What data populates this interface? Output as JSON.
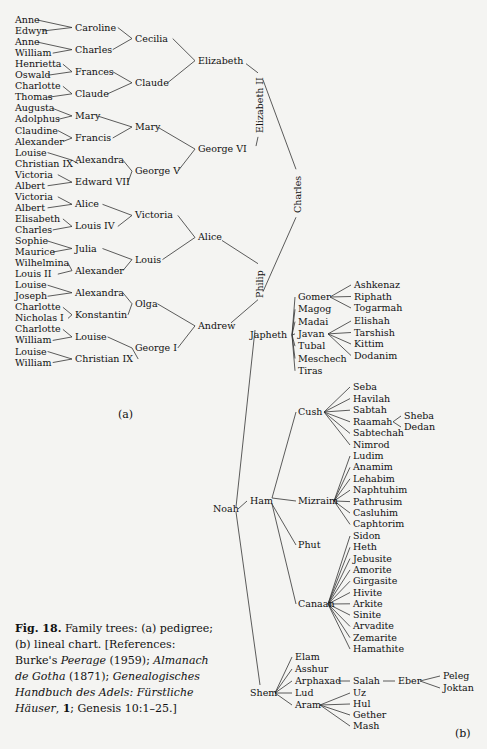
{
  "pedigree": {
    "label": "(a)",
    "gen4": [
      "Anne",
      "Edwyn",
      "Anne",
      "William",
      "Henrietta",
      "Oswald",
      "Charlotte",
      "Thomas",
      "Augusta",
      "Adolphus",
      "Claudine",
      "Alexander",
      "Louise",
      "Christian IX",
      "Victoria",
      "Albert",
      "Victoria",
      "Albert",
      "Elisabeth",
      "Charles",
      "Sophie",
      "Maurice",
      "Wilhelmina",
      "Louis II",
      "Louise",
      "Joseph",
      "Charlotte",
      "Nicholas I",
      "Charlotte",
      "William",
      "Louise",
      "William"
    ],
    "gen3": [
      "Caroline",
      "Charles",
      "Frances",
      "Claude",
      "Mary",
      "Francis",
      "Alexandra",
      "Edward VII",
      "Alice",
      "Louis IV",
      "Julia",
      "Alexander",
      "Alexandra",
      "Konstantin",
      "Louise",
      "Christian IX"
    ],
    "gen2": [
      "Cecilia",
      "Claude",
      "Mary",
      "George V",
      "Victoria",
      "Louis",
      "Olga",
      "George I"
    ],
    "gen1": [
      "Elizabeth",
      "George VI",
      "Alice",
      "Andrew"
    ],
    "gen0": [
      "Elizabeth II",
      "Philip"
    ],
    "root": "Charles"
  },
  "lineal": {
    "label": "(b)",
    "root": "Noah",
    "sons": [
      "Japheth",
      "Ham",
      "Shem"
    ],
    "japheth_children": [
      "Gomer",
      "Magog",
      "Madai",
      "Javan",
      "Tubal",
      "Meschech",
      "Tiras"
    ],
    "gomer_children": [
      "Ashkenaz",
      "Riphath",
      "Togarmah"
    ],
    "javan_children": [
      "Elishah",
      "Tarshish",
      "Kittim",
      "Dodanim"
    ],
    "ham_children": [
      "Cush",
      "Mizraim",
      "Phut",
      "Canaan"
    ],
    "cush_children": [
      "Seba",
      "Havilah",
      "Sabtah",
      "Raamah",
      "Sabtechah",
      "Nimrod"
    ],
    "raamah_children": [
      "Sheba",
      "Dedan"
    ],
    "mizraim_children": [
      "Ludim",
      "Anamim",
      "Lehabim",
      "Naphtuhim",
      "Pathrusim",
      "Casluhim",
      "Caphtorim"
    ],
    "canaan_children": [
      "Sidon",
      "Heth",
      "Jebusite",
      "Amorite",
      "Girgasite",
      "Hivite",
      "Arkite",
      "Sinite",
      "Arvadite",
      "Zemarite",
      "Hamathite"
    ],
    "shem_children": [
      "Elam",
      "Asshur",
      "Arphaxad",
      "Lud",
      "Aram"
    ],
    "arphaxad_line": [
      "Salah",
      "Eber"
    ],
    "eber_children": [
      "Peleg",
      "Joktan"
    ],
    "aram_children": [
      "Uz",
      "Hul",
      "Gether",
      "Mash"
    ]
  },
  "caption": {
    "fig": "Fig. 18.",
    "text1": " Family trees: (a) pedigree; (b) lineal chart. [References: Burke's ",
    "peerage": "Peerage",
    "text2": " (1959); ",
    "almanach": "Almanach de Gotha",
    "text3": " (1871); ",
    "handbuch": "Genealogisches Handbuch des Adels: Fürstliche Häuser",
    "text4": ", ",
    "vol": "1",
    "text5": "; Genesis 10:1–25.]"
  }
}
